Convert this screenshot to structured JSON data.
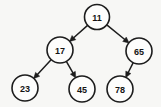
{
  "diagram": {
    "type": "tree",
    "canvas": {
      "width": 161,
      "height": 107
    },
    "colors": {
      "background": "#f7f7f5",
      "node_fill": "#fdfdfc",
      "stroke": "#1d1d1d",
      "label": "#141414"
    },
    "nodes": [
      {
        "id": "n11",
        "label": "11",
        "cx": 97,
        "cy": 17,
        "r": 12.5,
        "level": 0,
        "role": "root"
      },
      {
        "id": "n17",
        "label": "17",
        "cx": 60,
        "cy": 50,
        "r": 13.0,
        "level": 1,
        "role": "left-child"
      },
      {
        "id": "n65",
        "label": "65",
        "cx": 139,
        "cy": 51,
        "r": 13.0,
        "level": 1,
        "role": "right-child"
      },
      {
        "id": "n23",
        "label": "23",
        "cx": 25,
        "cy": 88,
        "r": 13.0,
        "level": 2,
        "role": "leaf"
      },
      {
        "id": "n45",
        "label": "45",
        "cx": 82,
        "cy": 89,
        "r": 13.0,
        "level": 2,
        "role": "leaf"
      },
      {
        "id": "n78",
        "label": "78",
        "cx": 120,
        "cy": 89,
        "r": 13.0,
        "level": 2,
        "role": "leaf"
      }
    ],
    "edges": [
      {
        "id": "e11-17",
        "from": "n11",
        "to": "n17",
        "direction": "down-left",
        "arrow": "to"
      },
      {
        "id": "e11-65",
        "from": "n11",
        "to": "n65",
        "direction": "down-right",
        "arrow": "to"
      },
      {
        "id": "e17-23",
        "from": "n17",
        "to": "n23",
        "direction": "down-left",
        "arrow": "to"
      },
      {
        "id": "e17-45",
        "from": "n17",
        "to": "n45",
        "direction": "down-right",
        "arrow": "to"
      },
      {
        "id": "e65-78",
        "from": "n65",
        "to": "n78",
        "direction": "down-left",
        "arrow": "to"
      }
    ]
  }
}
